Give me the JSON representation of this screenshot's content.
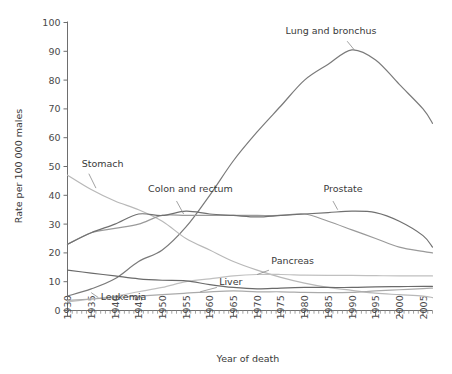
{
  "chart_data": {
    "type": "line",
    "title": "",
    "xlabel": "Year of death",
    "ylabel": "Rate per 100 000 males",
    "xlim": [
      1930,
      2007
    ],
    "ylim": [
      0,
      100
    ],
    "ytick_labels": [
      "0",
      "10",
      "20",
      "30",
      "40",
      "50",
      "60",
      "70",
      "80",
      "90",
      "100"
    ],
    "yticks": [
      0,
      10,
      20,
      30,
      40,
      50,
      60,
      70,
      80,
      90,
      100
    ],
    "xtick_labels": [
      "1930",
      "1935",
      "1940",
      "1945",
      "1950",
      "1955",
      "1960",
      "1965",
      "1970",
      "1975",
      "1980",
      "1985",
      "1990",
      "1995",
      "2000",
      "2005"
    ],
    "xticks": [
      1930,
      1935,
      1940,
      1945,
      1950,
      1955,
      1960,
      1965,
      1970,
      1975,
      1980,
      1985,
      1990,
      1995,
      2000,
      2005
    ],
    "minor_tick_interval": 1,
    "grid": false,
    "legend": "inline-annotations",
    "x": [
      1930,
      1935,
      1940,
      1945,
      1950,
      1955,
      1960,
      1965,
      1970,
      1975,
      1980,
      1985,
      1990,
      1995,
      2000,
      2005,
      2007
    ],
    "series": [
      {
        "name": "Lung and bronchus",
        "color": "#7a7a7a",
        "label_x": 1976,
        "label_y": 96,
        "values": [
          5,
          7.5,
          11,
          17,
          21,
          29,
          40,
          52,
          62,
          71,
          80,
          85.5,
          90.5,
          87,
          78.5,
          70,
          65
        ]
      },
      {
        "name": "Stomach",
        "color": "#b8b8b8",
        "label_x": 1933,
        "label_y": 50,
        "values": [
          47,
          42,
          38,
          35,
          31,
          25,
          21,
          17,
          14,
          11.5,
          9.5,
          8,
          7,
          6,
          5.5,
          5,
          4.5
        ]
      },
      {
        "name": "Colon and rectum",
        "color": "#9a9a9a",
        "label_x": 1947,
        "label_y": 41,
        "values": [
          23,
          27,
          28.5,
          30,
          33,
          33,
          33,
          33,
          33,
          33,
          33.5,
          31,
          28,
          25,
          22,
          20.5,
          20
        ]
      },
      {
        "name": "Prostate",
        "color": "#707070",
        "label_x": 1984,
        "label_y": 41,
        "values": [
          23,
          27,
          30,
          33.5,
          33,
          34.5,
          33.5,
          33,
          32.5,
          33,
          33.5,
          34,
          34.5,
          34,
          31,
          26,
          22
        ]
      },
      {
        "name": "Pancreas",
        "color": "#c0c0c0",
        "label_x": 1973,
        "label_y": 16,
        "values": [
          3,
          4,
          5,
          6.5,
          8,
          10,
          11,
          12,
          12.5,
          12.5,
          12.3,
          12.2,
          12.2,
          12.1,
          12,
          12,
          12
        ]
      },
      {
        "name": "Liver",
        "color": "#aaaaaa",
        "label_x": 1962,
        "label_y": 9,
        "values": [
          3.5,
          4,
          4.5,
          5,
          5.5,
          6,
          6.5,
          6.8,
          6.5,
          6.5,
          6.3,
          6.2,
          6.3,
          6.8,
          7.2,
          7.6,
          7.8
        ]
      },
      {
        "name": "Leukemia",
        "color": "#6a6a6a",
        "label_x": 1937,
        "label_y": 3.5,
        "values": [
          14,
          13,
          12,
          11,
          10.5,
          10.3,
          9,
          8,
          7.5,
          7.8,
          8,
          8,
          8,
          8.2,
          8.3,
          8.4,
          8.4
        ]
      }
    ]
  },
  "annotations": {
    "leaders": [
      {
        "name": "stomach-leader",
        "from_x": 1934.5,
        "from_y": 47.5,
        "to_x": 1936,
        "to_y": 42.5
      },
      {
        "name": "lung-leader",
        "from_x": 1989,
        "from_y": 93.5,
        "to_x": 1990.5,
        "to_y": 90.5
      },
      {
        "name": "colon-leader",
        "from_x": 1953,
        "from_y": 38,
        "to_x": 1954.5,
        "to_y": 33.5
      },
      {
        "name": "prostate-leader",
        "from_x": 1986,
        "from_y": 38,
        "to_x": 1987,
        "to_y": 35
      },
      {
        "name": "pancreas-leader",
        "from_x": 1972.5,
        "from_y": 14,
        "to_x": 1970,
        "to_y": 12.5
      },
      {
        "name": "liver-leader",
        "from_x": 1961.5,
        "from_y": 8,
        "to_x": 1958,
        "to_y": 6.5
      },
      {
        "name": "leukemia-leader",
        "from_x": 1936.5,
        "from_y": 4.5,
        "to_x": 1935,
        "to_y": 6.2
      }
    ]
  }
}
